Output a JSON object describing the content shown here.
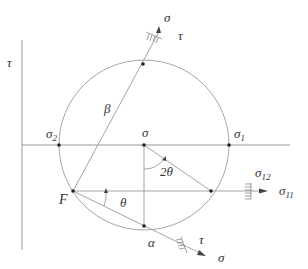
{
  "diagram": {
    "type": "Mohr's circle",
    "axes": {
      "vertical": "τ",
      "horizontal": "σ"
    },
    "labels": {
      "tau_axis": "τ",
      "sigma_center": "σ",
      "sigma1": "σ",
      "sigma1_sub": "1",
      "sigma2": "σ",
      "sigma2_sub": "2",
      "beta": "β",
      "two_theta": "2θ",
      "theta": "θ",
      "pole": "F",
      "alpha": "α",
      "sigma11": "σ",
      "sigma11_sub": "11",
      "sigma12": "σ",
      "sigma12_sub": "12",
      "top_sigma": "σ",
      "top_tau": "τ",
      "bottom_sigma": "σ",
      "bottom_tau": "τ"
    },
    "colors": {
      "line": "#9a9a9a",
      "point": "#222222",
      "text": "#333333"
    }
  }
}
